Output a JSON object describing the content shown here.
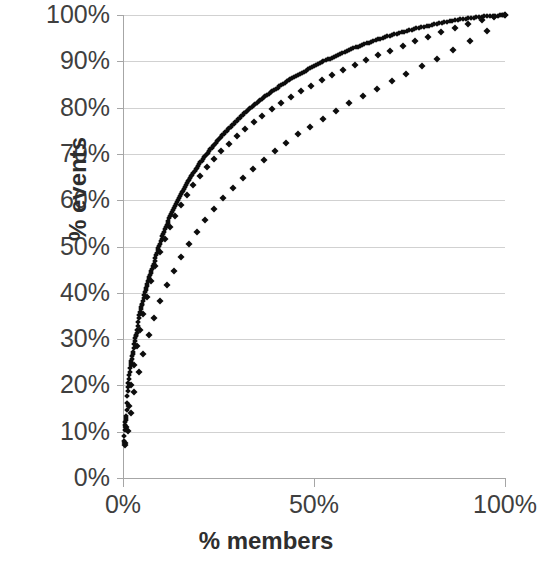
{
  "chart_data": {
    "type": "scatter",
    "title": "",
    "xlabel": "% members",
    "ylabel": "% events",
    "xlim": [
      0,
      100
    ],
    "ylim": [
      0,
      100
    ],
    "grid": true,
    "legend": "none",
    "marker": "diamond",
    "marker_color": "#0d0d0d",
    "gridline_color": "#c9c9c9",
    "axis_color": "#a6a6a6",
    "x_ticks": [
      "0%",
      "50%",
      "100%"
    ],
    "x_tick_values": [
      0,
      50,
      100
    ],
    "y_ticks": [
      "0%",
      "10%",
      "20%",
      "30%",
      "40%",
      "50%",
      "60%",
      "70%",
      "80%",
      "90%",
      "100%"
    ],
    "y_tick_values": [
      0,
      10,
      20,
      30,
      40,
      50,
      60,
      70,
      80,
      90,
      100
    ],
    "series": [
      {
        "name": "series-1",
        "x": [
          0.3,
          0.6,
          0.9,
          1.2,
          1.5,
          1.9,
          2.3,
          2.7,
          3.1,
          3.6,
          4.1,
          4.6,
          5.1,
          5.7,
          6.3,
          6.9,
          7.5,
          8.2,
          8.9,
          9.6,
          10.3,
          11.1,
          11.9,
          12.7,
          13.5,
          14.4,
          15.3,
          16.2,
          17.2,
          18.2,
          19.2,
          20.3,
          21.4,
          22.5,
          23.7,
          24.9,
          26.1,
          27.4,
          28.7,
          30.0,
          31.4,
          32.8,
          34.2,
          35.7,
          37.2,
          38.8,
          40.4,
          42.0,
          43.7,
          45.4,
          47.1,
          48.9,
          50.7,
          52.5,
          54.4,
          56.3,
          58.2,
          60.2,
          62.2,
          64.2,
          66.3,
          68.4,
          70.5,
          72.7,
          74.9,
          77.1,
          79.4,
          81.7,
          84.0,
          86.4,
          88.8,
          91.2,
          93.6,
          96.1,
          98.5,
          100.0
        ],
        "y": [
          8.0,
          12.0,
          13.2,
          18.2,
          21.2,
          24.0,
          25.6,
          27.4,
          30.2,
          31.3,
          34.2,
          36.6,
          37.8,
          40.2,
          41.6,
          43.4,
          44.8,
          46.6,
          48.8,
          50.4,
          52.2,
          54.0,
          55.6,
          57.2,
          58.7,
          60.2,
          61.6,
          63.0,
          64.3,
          65.6,
          66.9,
          68.2,
          69.4,
          70.6,
          71.8,
          73.0,
          74.1,
          75.2,
          76.3,
          77.4,
          78.5,
          79.5,
          80.5,
          81.5,
          82.5,
          83.4,
          84.3,
          85.2,
          86.1,
          86.9,
          87.7,
          88.5,
          89.3,
          90.0,
          90.7,
          91.4,
          92.1,
          92.8,
          93.4,
          94.0,
          94.6,
          95.2,
          95.7,
          96.2,
          96.7,
          97.2,
          97.6,
          98.0,
          98.4,
          98.8,
          99.1,
          99.4,
          99.6,
          99.8,
          99.9,
          100.0
        ]
      },
      {
        "name": "series-2",
        "x": [
          0.4,
          0.9,
          1.5,
          2.1,
          2.8,
          3.6,
          4.4,
          5.3,
          6.3,
          7.4,
          8.5,
          9.7,
          11.0,
          12.3,
          13.7,
          15.2,
          16.8,
          18.4,
          20.1,
          21.9,
          23.8,
          25.7,
          27.7,
          29.8,
          32.0,
          34.2,
          36.5,
          38.9,
          41.4,
          43.9,
          46.5,
          49.2,
          52.0,
          54.8,
          57.7,
          60.7,
          63.7,
          66.8,
          70.0,
          73.2,
          76.5,
          79.9,
          83.3,
          86.8,
          90.3,
          93.9,
          97.0,
          100.0
        ],
        "y": [
          7.5,
          11.0,
          15.5,
          20.0,
          24.5,
          28.5,
          32.0,
          35.5,
          39.0,
          42.5,
          45.8,
          48.8,
          51.6,
          54.2,
          56.6,
          58.9,
          61.1,
          63.2,
          65.2,
          67.1,
          68.9,
          70.6,
          72.2,
          73.8,
          75.3,
          76.8,
          78.2,
          79.6,
          80.9,
          82.2,
          83.5,
          84.7,
          85.9,
          87.0,
          88.1,
          89.2,
          90.3,
          91.3,
          92.3,
          93.3,
          94.3,
          95.3,
          96.3,
          97.2,
          98.1,
          99.0,
          99.6,
          100.0
        ]
      },
      {
        "name": "series-3",
        "x": [
          0.5,
          1.2,
          2.0,
          3.0,
          4.1,
          5.3,
          6.7,
          8.2,
          9.8,
          11.5,
          13.3,
          15.2,
          17.2,
          19.3,
          21.5,
          23.8,
          26.2,
          28.7,
          31.3,
          34.0,
          36.8,
          39.7,
          42.7,
          45.8,
          49.0,
          52.3,
          55.7,
          59.2,
          62.8,
          66.5,
          70.3,
          74.2,
          78.2,
          82.3,
          86.5,
          90.8,
          95.2,
          100.0
        ],
        "y": [
          7.2,
          10.2,
          14.0,
          18.5,
          22.8,
          26.8,
          30.8,
          34.6,
          38.2,
          41.6,
          44.8,
          47.8,
          50.6,
          53.2,
          55.7,
          58.1,
          60.4,
          62.6,
          64.7,
          66.7,
          68.7,
          70.6,
          72.4,
          74.2,
          75.9,
          77.6,
          79.3,
          80.9,
          82.5,
          84.1,
          85.7,
          87.3,
          88.9,
          90.6,
          92.4,
          94.4,
          96.6,
          100.0
        ]
      }
    ]
  }
}
